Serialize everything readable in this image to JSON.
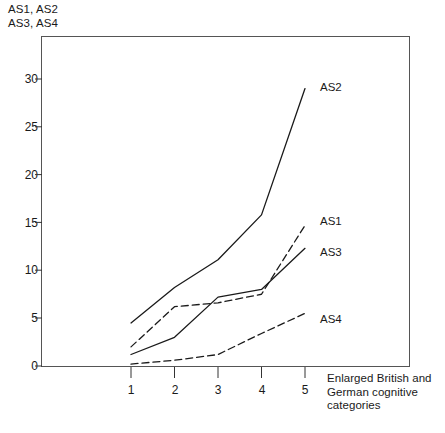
{
  "chart_data": {
    "type": "line",
    "title": "",
    "ylabel": "AS1, AS2 AS3, AS4",
    "ylabel_lines": [
      "AS1, AS2",
      "AS3, AS4"
    ],
    "xlabel": "Enlarged British and German cognitive categories",
    "xlabel_lines": [
      "Enlarged British and",
      "German cognitive",
      "categories"
    ],
    "x": [
      1,
      2,
      3,
      4,
      5
    ],
    "categories": [
      "1",
      "2",
      "3",
      "4",
      "5"
    ],
    "xtick_labels": [
      "1",
      "2",
      "3",
      "4",
      "5"
    ],
    "ytick_labels": [
      "0",
      "5",
      "10",
      "15",
      "20",
      "25",
      "30"
    ],
    "yticks": [
      0,
      5,
      10,
      15,
      20,
      25,
      30
    ],
    "ylim": [
      0,
      31.5
    ],
    "xlim": [
      0.55,
      5.55
    ],
    "grid": false,
    "legend_position": "inline-right-of-line-ends",
    "series": [
      {
        "name": "AS2",
        "label": "AS2",
        "style": "solid",
        "color": "#1a1a1a",
        "values": [
          4.5,
          8.2,
          11.1,
          15.8,
          29.0
        ]
      },
      {
        "name": "AS1",
        "label": "AS1",
        "style": "dashed",
        "color": "#1a1a1a",
        "values": [
          2.0,
          6.2,
          6.6,
          7.5,
          14.7
        ]
      },
      {
        "name": "AS3",
        "label": "AS3",
        "style": "solid",
        "color": "#1a1a1a",
        "values": [
          1.2,
          3.0,
          7.2,
          8.0,
          12.3
        ]
      },
      {
        "name": "AS4",
        "label": "AS4",
        "style": "dashed",
        "color": "#1a1a1a",
        "values": [
          0.2,
          0.6,
          1.2,
          3.4,
          5.5
        ]
      }
    ],
    "annotations": [
      {
        "text": "AS2",
        "series": "AS2"
      },
      {
        "text": "AS1",
        "series": "AS1"
      },
      {
        "text": "AS3",
        "series": "AS3"
      },
      {
        "text": "AS4",
        "series": "AS4"
      }
    ]
  },
  "axis": {
    "y_caption_line1": "AS1, AS2",
    "y_caption_line2": "AS3, AS4",
    "x_caption_line1": "Enlarged British and",
    "x_caption_line2": "German cognitive",
    "x_caption_line3": "categories"
  },
  "colors": {
    "line": "#1a1a1a",
    "frame": "#555555",
    "background": "#ffffff"
  }
}
